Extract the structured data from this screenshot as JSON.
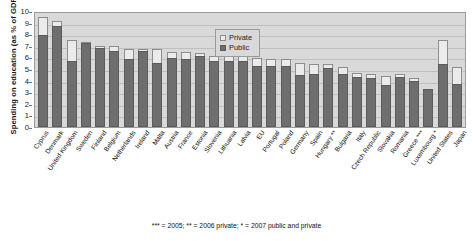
{
  "axis": {
    "y_title": "Spending on education (as % of GDP)",
    "ticks": [
      "10",
      "9",
      "8",
      "7",
      "6",
      "5",
      "4",
      "3",
      "2",
      "1",
      "0"
    ]
  },
  "legend": {
    "private_label": "Private",
    "public_label": "Public"
  },
  "footnote": "*** = 2005;   ** = 2006 private;   * = 2007 public and private",
  "colors": {
    "public": "#6e6e6e",
    "private": "#ebebeb",
    "plot_background": "#d9d9d9",
    "gridline": "#bfbfbf"
  },
  "chart_data": {
    "type": "bar",
    "title": "",
    "xlabel": "",
    "ylabel": "Spending on education (as % of GDP)",
    "ylim": [
      0,
      10
    ],
    "grid": true,
    "legend_position": "top-center",
    "stacked": true,
    "categories": [
      "Cyprus",
      "Denmark",
      "United Kingdom",
      "Sweden",
      "Finland",
      "Belgium",
      "Netherlands",
      "Ireland",
      "Malta",
      "Austria",
      "France",
      "Estonia",
      "Slovenia",
      "Lithuania",
      "Latvia",
      "EU",
      "Portugal",
      "Poland",
      "Germany",
      "Spain",
      "Hungary **",
      "Bulgaria",
      "Italy",
      "Czech Republic",
      "Slovakia",
      "Romania",
      "Greece ***",
      "Luxembourg *",
      "United States",
      "Japan"
    ],
    "series": [
      {
        "name": "Public",
        "values": [
          7.95,
          8.7,
          5.65,
          7.25,
          6.85,
          6.55,
          5.9,
          6.55,
          5.5,
          5.95,
          5.9,
          6.1,
          5.7,
          5.65,
          5.65,
          5.25,
          5.3,
          5.25,
          4.5,
          4.55,
          5.1,
          4.6,
          4.3,
          4.2,
          3.6,
          4.3,
          4.0,
          3.3,
          5.4,
          3.75
        ]
      },
      {
        "name": "Private",
        "values": [
          1.55,
          0.4,
          1.85,
          0.1,
          0.15,
          0.45,
          0.8,
          0.2,
          1.2,
          0.5,
          0.55,
          0.3,
          0.45,
          0.5,
          0.45,
          0.7,
          0.6,
          0.65,
          1.0,
          0.9,
          0.3,
          0.6,
          0.4,
          0.4,
          0.8,
          0.25,
          0.2,
          0.0,
          2.1,
          1.45
        ]
      }
    ],
    "totals": [
      9.5,
      9.1,
      7.5,
      7.35,
      7.0,
      7.0,
      6.7,
      6.75,
      6.7,
      6.45,
      6.45,
      6.4,
      6.15,
      6.15,
      6.1,
      5.95,
      5.9,
      5.9,
      5.5,
      5.45,
      5.4,
      5.2,
      4.7,
      4.6,
      4.4,
      4.55,
      4.2,
      3.3,
      7.5,
      5.2
    ]
  }
}
